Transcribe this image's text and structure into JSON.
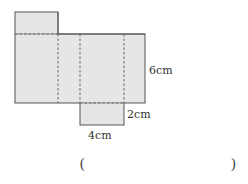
{
  "diagram": {
    "type": "net-of-cuboid",
    "colors": {
      "fill": "#e6e6e6",
      "stroke": "#555555",
      "dash": "#666666",
      "text": "#333333"
    },
    "labels": {
      "height": "6cm",
      "depth": "2cm",
      "width": "4cm"
    }
  },
  "answer": {
    "open_paren": "(",
    "close_paren": ")",
    "value": ""
  }
}
